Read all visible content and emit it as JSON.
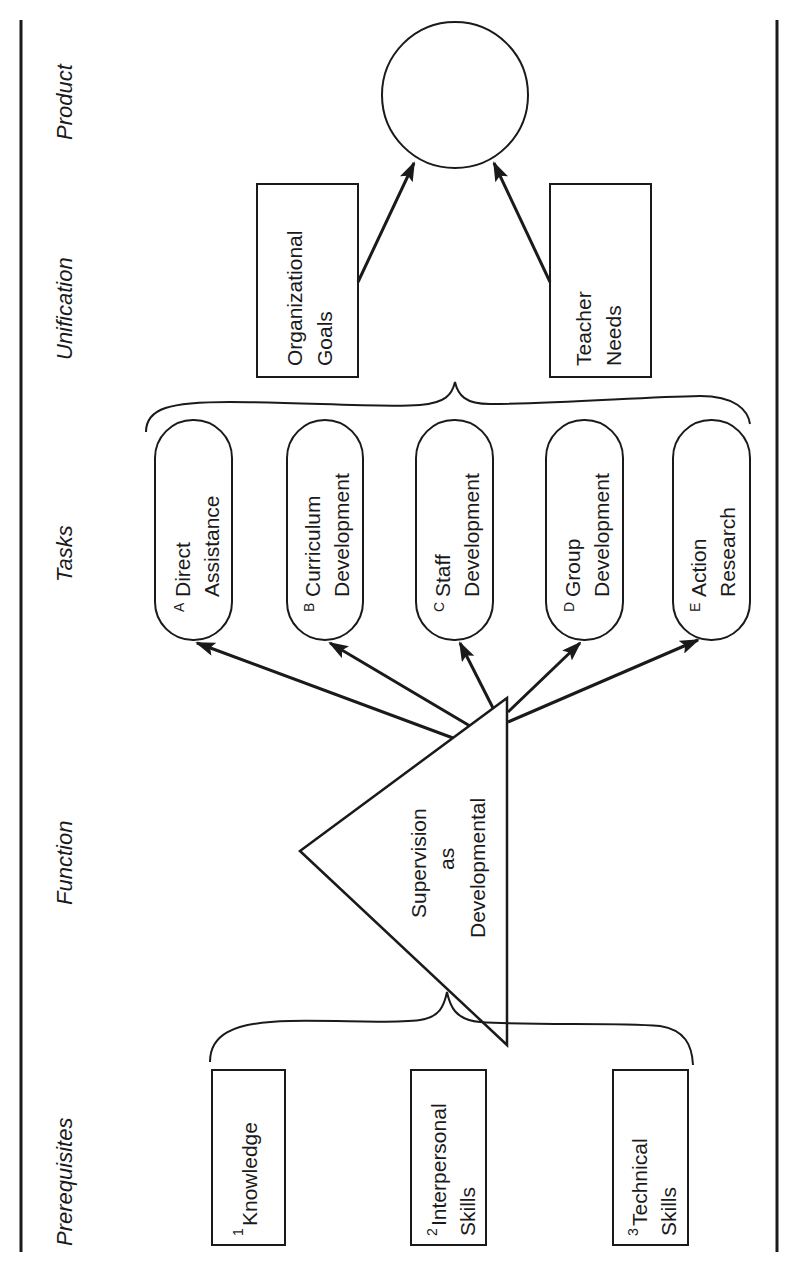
{
  "headers": {
    "product": "Product",
    "unification": "Unification",
    "tasks": "Tasks",
    "function": "Function",
    "prerequisites": "Prerequisites"
  },
  "product": {
    "shape": "circle",
    "label": ""
  },
  "unification": {
    "organizational_goals": {
      "line1": "Organizational",
      "line2": "Goals"
    },
    "teacher_needs": {
      "line1": "Teacher",
      "line2": "Needs"
    }
  },
  "tasks": [
    {
      "letter": "A",
      "line1": "Direct",
      "line2": "Assistance"
    },
    {
      "letter": "B",
      "line1": "Curriculum",
      "line2": "Development"
    },
    {
      "letter": "C",
      "line1": "Staff",
      "line2": "Development"
    },
    {
      "letter": "D",
      "line1": "Group",
      "line2": "Development"
    },
    {
      "letter": "E",
      "line1": "Action",
      "line2": "Research"
    }
  ],
  "function": {
    "line1": "Supervision",
    "line2": "as",
    "line3": "Developmental"
  },
  "prerequisites": [
    {
      "number": "1",
      "line1": "Knowledge",
      "line2": ""
    },
    {
      "number": "2",
      "line1": "Interpersonal",
      "line2": "Skills"
    },
    {
      "number": "3",
      "line1": "Technical",
      "line2": "Skills"
    }
  ],
  "colors": {
    "ink": "#1a1a1a",
    "background": "#ffffff"
  }
}
